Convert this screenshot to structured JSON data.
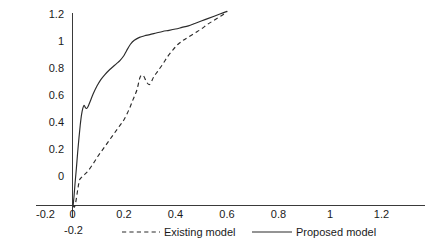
{
  "chart_data": {
    "type": "line",
    "title": "",
    "subtitle": "",
    "xlabel": "",
    "ylabel": "",
    "xlim": [
      -0.2,
      1.2
    ],
    "ylim": [
      -0.2,
      1.2
    ],
    "grid": false,
    "legend_position": "bottom",
    "xticks": [
      "-0.2",
      "0",
      "0.2",
      "0.4",
      "0.6",
      "0.8",
      "1",
      "1.2"
    ],
    "xtick_values": [
      -0.2,
      0,
      0.2,
      0.4,
      0.6,
      0.8,
      1,
      1.2
    ],
    "yticks": [
      "-0.2",
      "0",
      "0.2",
      "0.4",
      "0.6",
      "0.8",
      "1",
      "1.2"
    ],
    "ytick_values": [
      -0.2,
      0,
      0.2,
      0.4,
      0.6,
      0.8,
      1,
      1.2
    ],
    "series": [
      {
        "name": "Existing model",
        "style": "dashed",
        "color": "#2b2b2b",
        "x": [
          0.005,
          0.015,
          0.025,
          0.035,
          0.045,
          0.055,
          0.07,
          0.09,
          0.12,
          0.16,
          0.2,
          0.24,
          0.28,
          0.32,
          0.36,
          0.4,
          0.44,
          0.47,
          0.5,
          0.525,
          0.55,
          0.575,
          0.6,
          0.63,
          0.66,
          0.7,
          0.74,
          0.78,
          0.82,
          0.86,
          0.9,
          0.95,
          1.0,
          1.05,
          1.1,
          1.15,
          1.2
        ],
        "y": [
          0.0,
          -0.01,
          0.02,
          0.07,
          0.12,
          0.16,
          0.175,
          0.19,
          0.215,
          0.26,
          0.31,
          0.355,
          0.4,
          0.445,
          0.49,
          0.535,
          0.6,
          0.66,
          0.72,
          0.8,
          0.81,
          0.77,
          0.755,
          0.8,
          0.835,
          0.88,
          0.93,
          0.97,
          1.005,
          1.03,
          1.05,
          1.075,
          1.1,
          1.13,
          1.155,
          1.18,
          1.205
        ]
      },
      {
        "name": "Proposed model",
        "style": "solid",
        "color": "#2b2b2b",
        "x": [
          0.005,
          0.012,
          0.02,
          0.03,
          0.04,
          0.05,
          0.06,
          0.07,
          0.08,
          0.09,
          0.1,
          0.11,
          0.12,
          0.14,
          0.16,
          0.19,
          0.22,
          0.25,
          0.28,
          0.31,
          0.34,
          0.37,
          0.4,
          0.42,
          0.45,
          0.48,
          0.52,
          0.56,
          0.6,
          0.65,
          0.7,
          0.75,
          0.8,
          0.85,
          0.9,
          0.95,
          1.0,
          1.05,
          1.1,
          1.15,
          1.2
        ],
        "y": [
          0.0,
          0.06,
          0.14,
          0.23,
          0.33,
          0.42,
          0.5,
          0.565,
          0.605,
          0.625,
          0.61,
          0.605,
          0.615,
          0.655,
          0.695,
          0.745,
          0.785,
          0.815,
          0.84,
          0.862,
          0.883,
          0.905,
          0.935,
          0.965,
          1.005,
          1.03,
          1.048,
          1.058,
          1.065,
          1.075,
          1.085,
          1.092,
          1.1,
          1.11,
          1.12,
          1.135,
          1.15,
          1.165,
          1.18,
          1.195,
          1.21
        ]
      }
    ],
    "legend": [
      {
        "label": "Existing model",
        "style": "dashed"
      },
      {
        "label": "Proposed model",
        "style": "solid"
      }
    ]
  },
  "legend_labels": {
    "existing": "Existing model",
    "proposed": "Proposed model"
  },
  "axis_labels": {
    "x": [
      "-0.2",
      "0",
      "0.2",
      "0.4",
      "0.6",
      "0.8",
      "1",
      "1.2"
    ],
    "y": [
      "-0.2",
      "0",
      "0.2",
      "0.4",
      "0.6",
      "0.8",
      "1",
      "1.2"
    ]
  }
}
